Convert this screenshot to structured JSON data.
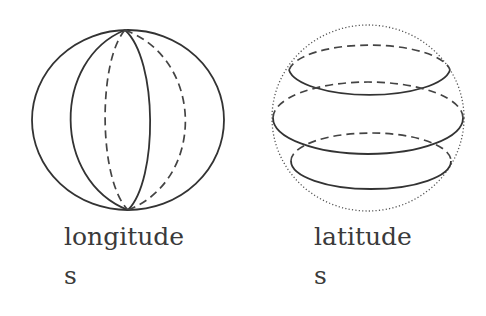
{
  "figures": [
    {
      "id": "longitude",
      "label_lines": [
        "longitude",
        "s"
      ],
      "description": "sphere with meridian lines"
    },
    {
      "id": "latitude",
      "label_lines": [
        "latitude",
        "s"
      ],
      "description": "sphere with parallel lines"
    }
  ],
  "colors": {
    "stroke": "#333333",
    "text": "#3a3a3a",
    "background": "#ffffff"
  }
}
